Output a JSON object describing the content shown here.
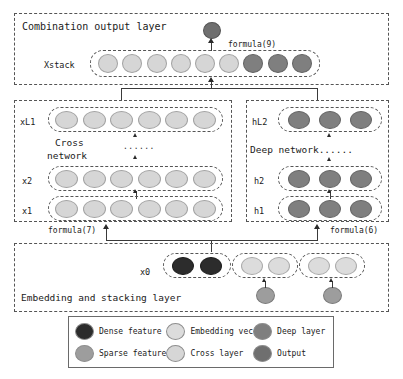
{
  "figure": {
    "type": "neural-network-architecture-diagram",
    "background_color": "#ffffff"
  },
  "sections": {
    "combination": {
      "title": "Combination output layer",
      "xstack_label": "Xstack",
      "formula_label": "formula(9)"
    },
    "cross": {
      "title_line1": "Cross",
      "title_line2": "network",
      "ellipsis": "......",
      "formula_label": "formula(7)",
      "row_labels": [
        "xL1",
        "x2",
        "x1"
      ]
    },
    "deep": {
      "title": "Deep network......",
      "formula_label": "formula(6)",
      "row_labels": [
        "hL2",
        "h2",
        "h1"
      ]
    },
    "embedding": {
      "title": "Embedding and stacking layer",
      "x0_label": "x0"
    }
  },
  "nodes": {
    "xstack": [
      "cross",
      "cross",
      "cross",
      "cross",
      "cross",
      "cross",
      "deep",
      "deep",
      "deep"
    ],
    "output": "output",
    "cross_rows": [
      [
        "cross",
        "cross",
        "cross",
        "cross",
        "cross",
        "cross"
      ],
      [
        "cross",
        "cross",
        "cross",
        "cross",
        "cross",
        "cross"
      ],
      [
        "cross",
        "cross",
        "cross",
        "cross",
        "cross",
        "cross"
      ]
    ],
    "deep_rows": [
      [
        "deep",
        "deep",
        "deep"
      ],
      [
        "deep",
        "deep",
        "deep"
      ],
      [
        "deep",
        "deep",
        "deep"
      ]
    ],
    "x0_groups": [
      {
        "name": "dense-group",
        "nodes": [
          "dense",
          "dense"
        ]
      },
      {
        "name": "embedding-group-1",
        "nodes": [
          "embed",
          "embed"
        ]
      },
      {
        "name": "embedding-group-2",
        "nodes": [
          "embed",
          "embed"
        ]
      }
    ],
    "sparse_inputs": [
      "sparse",
      "sparse"
    ]
  },
  "legend": {
    "items": [
      {
        "label": "Dense feature",
        "color": "#2c2c2c",
        "kind": "dense"
      },
      {
        "label": "Embedding vec",
        "color": "#dcdcdc",
        "kind": "embed"
      },
      {
        "label": "Deep layer",
        "color": "#7f7f7f",
        "kind": "deep"
      },
      {
        "label": "Sparse feature",
        "color": "#9d9d9d",
        "kind": "sparse"
      },
      {
        "label": "Cross layer",
        "color": "#d6d6d6",
        "kind": "cross"
      },
      {
        "label": "Output",
        "color": "#6f6f6f",
        "kind": "output"
      }
    ]
  },
  "colors": {
    "dense": "#2c2c2c",
    "sparse": "#9d9d9d",
    "embed": "#dcdcdc",
    "cross": "#d6d6d6",
    "deep": "#7f7f7f",
    "output": "#6f6f6f",
    "border": "#555555",
    "connector": "#3a3a3a"
  }
}
